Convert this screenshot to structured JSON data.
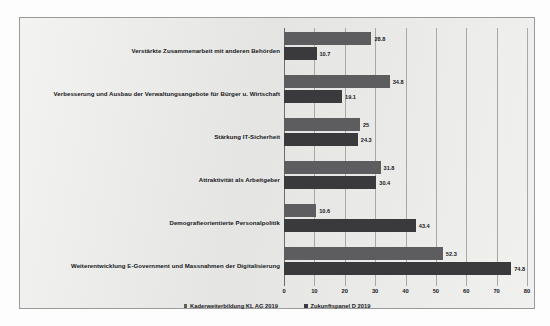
{
  "page": {
    "background_note": "scanned document page",
    "bleed_through_lines": [
      "Kader sind 20 Jahre jünger",
      "Arbeitsmarkt in diesem Verständnis",
      "ist und 180 Mitarbeitende. Das",
      "und ihre Erfahrungen, die sie",
      "Zusammenarbeit der Ausbildung",
      "der E-Government Strategie",
      "mit Massnahmen der Digitalisierung",
      "der Bundes in Digitalisierung",
      "Entwicklung Bereiche: Verwaltung",
      "Die Anforderungen an Beispiel",
      "Personalpolitik wird weiter",
      "eine sehr an unseren Bereichen",
      "die Federführende Teamentwicklung",
      "Anforderungen aus der Zukunft",
      "120 Mitarbeitende in Verwaltung"
    ]
  },
  "chart_data": {
    "type": "bar",
    "orientation": "horizontal",
    "title": "",
    "xlabel": "",
    "ylabel": "",
    "xlim": [
      0,
      80
    ],
    "xticks": [
      0,
      10,
      20,
      30,
      40,
      50,
      60,
      70,
      80
    ],
    "grid": true,
    "legend_position": "bottom",
    "categories": [
      "Verstärkte Zusammenarbeit mit anderen Behörden",
      "Verbesserung und Ausbau der Verwaltungsangebote für Bürger u. Wirtschaft",
      "Stärkung IT-Sicherheit",
      "Attraktivität als Arbeitgeber",
      "Demografieorientierte Personalpolitik",
      "Weiterentwicklung E-Government und Massnahmen der Digitalisierung"
    ],
    "series": [
      {
        "name": "Kaderweiterbildung KL AG 2019",
        "color": "#5d5d5f",
        "values": [
          28.8,
          34.8,
          25,
          31.8,
          10.6,
          52.3
        ],
        "labels": [
          "28.8",
          "34.8",
          "25",
          "31.8",
          "10.6",
          "52.3"
        ]
      },
      {
        "name": "Zukunftspanel D 2019",
        "color": "#3a3a3c",
        "values": [
          10.7,
          19.1,
          24.3,
          30.4,
          43.4,
          74.8
        ],
        "labels": [
          "10.7",
          "19.1",
          "24.3",
          "30.4",
          "43.4",
          "74.8"
        ]
      }
    ]
  }
}
